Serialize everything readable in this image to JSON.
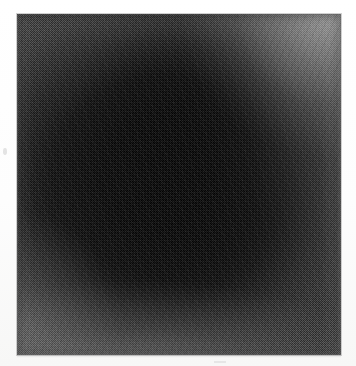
{
  "image": {
    "kind": "scanned-halftone-figure",
    "caption": "",
    "alt_text": "Dark, near-black square panel with fine dithered halftone grain; a large diffuse dark mass fills the centre-left while the tone lightens toward the top-right corner and the lower edges.",
    "background_color": "#fefefe",
    "panel": {
      "x": 17,
      "y": 14,
      "width": 324,
      "height": 341,
      "fill_color": "#232323",
      "darkest_color": "#0a0a0a",
      "lightest_color": "#4e4e4e",
      "trim_color": "#787878",
      "texture": "checkerboard-dither"
    },
    "margins": {
      "left": 17,
      "top": 14,
      "right": 15,
      "bottom": 11
    }
  },
  "chart_data": {
    "type": "heatmap",
    "title": "",
    "subtitle": "",
    "xlabel": "",
    "ylabel": "",
    "grid": false,
    "legend": "none",
    "colorscale": [
      "#0a0a0a",
      "#1d1d1d",
      "#2b2b2b",
      "#3a3a3a",
      "#4e4e4e"
    ],
    "value_range": [
      10,
      78
    ],
    "x": [
      0,
      1,
      2,
      3,
      4,
      5,
      6,
      7
    ],
    "y": [
      0,
      1,
      2,
      3,
      4,
      5,
      6,
      7
    ],
    "xticklabels": [
      "",
      "",
      "",
      "",
      "",
      "",
      "",
      ""
    ],
    "yticklabels": [
      "",
      "",
      "",
      "",
      "",
      "",
      "",
      ""
    ],
    "note": "Luminance sampled on an 8x8 grid across the panel; rows run top to bottom, columns left to right. Values are approximate 0-255 grey levels read from the scan.",
    "values": [
      [
        44,
        40,
        36,
        33,
        34,
        46,
        62,
        74
      ],
      [
        38,
        32,
        26,
        22,
        24,
        36,
        52,
        66
      ],
      [
        33,
        26,
        19,
        15,
        17,
        27,
        41,
        54
      ],
      [
        31,
        23,
        15,
        11,
        13,
        21,
        33,
        45
      ],
      [
        32,
        24,
        15,
        11,
        12,
        19,
        30,
        41
      ],
      [
        35,
        27,
        19,
        14,
        15,
        22,
        32,
        42
      ],
      [
        41,
        34,
        27,
        22,
        23,
        29,
        37,
        46
      ],
      [
        52,
        47,
        42,
        38,
        38,
        42,
        48,
        55
      ]
    ]
  }
}
